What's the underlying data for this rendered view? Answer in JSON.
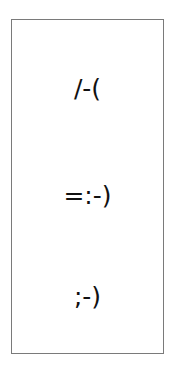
{
  "card": {
    "items": [
      {
        "text": "/-(",
        "meaning": "frown"
      },
      {
        "text": "=:-)",
        "meaning": "smile"
      },
      {
        "text": ";-)",
        "meaning": "wink"
      }
    ]
  },
  "colors": {
    "background": "#ffffff",
    "border": "#7a7a7a",
    "text": "#111111"
  }
}
